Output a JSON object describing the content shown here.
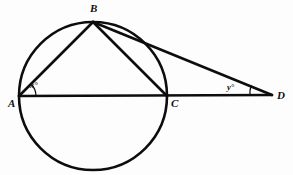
{
  "figure": {
    "type": "circle-geometry-diagram",
    "background_color": "#fdfdfd",
    "stroke_color": "#0d0d0d",
    "width": 293,
    "height": 175
  },
  "circle": {
    "center_x": 93,
    "center_y": 96,
    "radius": 74,
    "stroke_width": 2.6
  },
  "points": [
    {
      "id": "A",
      "label": "A",
      "x": 19,
      "y": 96,
      "on_circle": true,
      "label_x": 8,
      "label_y": 98
    },
    {
      "id": "B",
      "label": "B",
      "x": 93,
      "y": 22,
      "on_circle": true,
      "label_x": 90,
      "label_y": 3
    },
    {
      "id": "C",
      "label": "C",
      "x": 167,
      "y": 96,
      "on_circle": true,
      "label_x": 171,
      "label_y": 98
    },
    {
      "id": "D",
      "label": "D",
      "x": 272,
      "y": 95,
      "on_circle": false,
      "label_x": 277,
      "label_y": 90
    }
  ],
  "segments": [
    {
      "id": "AB",
      "from": "A",
      "to": "B",
      "kind": "chord"
    },
    {
      "id": "BC",
      "from": "B",
      "to": "C",
      "kind": "chord"
    },
    {
      "id": "AD",
      "from": "A",
      "to": "D",
      "kind": "secant",
      "note": "passes through C, diameter AC extended to D"
    },
    {
      "id": "BD",
      "from": "B",
      "to": "D",
      "kind": "secant"
    }
  ],
  "angles": [
    {
      "id": "x",
      "label": "x°",
      "vertex": "A",
      "between": [
        "AB",
        "AD"
      ],
      "label_x": 30,
      "label_y": 81,
      "arc_radius": 17
    },
    {
      "id": "y",
      "label": "y°",
      "vertex": "D",
      "between": [
        "DB",
        "DA"
      ],
      "label_x": 227,
      "label_y": 83,
      "arc_radius": 22
    }
  ]
}
